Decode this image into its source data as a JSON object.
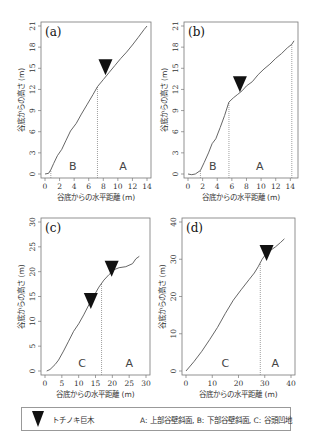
{
  "chart_data": [
    {
      "id": "a",
      "type": "line",
      "panel_label": "(a)",
      "xlabel": "谷底からの水平距離 (m)",
      "ylabel": "谷底からの高さ (m)",
      "xlim": [
        0,
        14
      ],
      "ylim": [
        0,
        21
      ],
      "xticks": [
        0,
        2,
        4,
        6,
        8,
        10,
        12,
        14
      ],
      "yticks": [
        0,
        3,
        6,
        9,
        12,
        15,
        18,
        21
      ],
      "x": [
        0,
        0.5,
        0.8,
        1.2,
        1.7,
        2.3,
        2.9,
        3.5,
        4.3,
        5.0,
        5.8,
        6.6,
        7.2,
        8.0,
        8.8,
        9.6,
        10.4,
        11.2,
        12.0,
        12.8,
        13.6,
        14.0
      ],
      "y": [
        0,
        0.1,
        0.6,
        1.5,
        2.6,
        3.5,
        4.8,
        6.1,
        7.2,
        8.5,
        9.9,
        11.3,
        12.4,
        13.4,
        14.4,
        15.4,
        16.4,
        17.3,
        18.3,
        19.4,
        20.5,
        21.0
      ],
      "boundaries_x": [
        0.8,
        7.2
      ],
      "zones": [
        {
          "label": "B",
          "x": 3.8
        },
        {
          "label": "A",
          "x": 10.7
        }
      ],
      "tree_markers": [
        {
          "x": 8.3,
          "y": 14.0
        }
      ]
    },
    {
      "id": "b",
      "type": "line",
      "panel_label": "(b)",
      "xlabel": "谷底からの水平距離 (m)",
      "ylabel": "谷底からの高さ (m)",
      "xlim": [
        0,
        14.5
      ],
      "ylim": [
        0,
        21
      ],
      "xticks": [
        0,
        2,
        4,
        6,
        8,
        10,
        12,
        14
      ],
      "yticks": [
        0,
        3,
        6,
        9,
        12,
        15,
        18,
        21
      ],
      "x": [
        0,
        0.5,
        1.0,
        1.7,
        2.2,
        2.8,
        3.3,
        3.8,
        4.4,
        5.0,
        5.6,
        6.2,
        6.8,
        7.4,
        8.0,
        8.8,
        9.6,
        10.4,
        11.2,
        12.0,
        12.8,
        13.6,
        14.2,
        14.5
      ],
      "y": [
        0,
        -0.1,
        0.0,
        0.5,
        1.6,
        3.0,
        4.3,
        5.0,
        6.6,
        8.3,
        10.2,
        10.8,
        11.3,
        11.8,
        12.5,
        13.1,
        14.1,
        14.9,
        15.6,
        16.4,
        17.1,
        17.9,
        18.4,
        18.9
      ],
      "boundaries_x": [
        1.7,
        5.6,
        14.2
      ],
      "zones": [
        {
          "label": "B",
          "x": 3.4
        },
        {
          "label": "A",
          "x": 9.8
        }
      ],
      "tree_markers": [
        {
          "x": 7.1,
          "y": 11.6
        }
      ]
    },
    {
      "id": "c",
      "type": "line",
      "panel_label": "(c)",
      "xlabel": "谷底からの水平距離 (m)",
      "ylabel": "谷底からの高さ (m)",
      "xlim": [
        0,
        30
      ],
      "ylim": [
        0,
        30
      ],
      "xticks": [
        0,
        5,
        10,
        15,
        20,
        25,
        30
      ],
      "yticks": [
        0,
        5,
        10,
        15,
        20,
        25,
        30
      ],
      "x": [
        0.5,
        1.5,
        3,
        4,
        5.5,
        7,
        8.5,
        10,
        11.5,
        13,
        14.5,
        16,
        17.5,
        19,
        20.5,
        22,
        24,
        26,
        27,
        28
      ],
      "y": [
        0,
        0.3,
        1.3,
        2.2,
        4.0,
        6.0,
        8.0,
        9.5,
        11.3,
        13.3,
        15.1,
        16.9,
        18.3,
        19.4,
        20.4,
        20.8,
        21.0,
        21.6,
        22.6,
        23.1
      ],
      "boundaries_x": [
        16.8
      ],
      "zones": [
        {
          "label": "C",
          "x": 11
        },
        {
          "label": "A",
          "x": 25
        }
      ],
      "tree_markers": [
        {
          "x": 13.6,
          "y": 12.5
        },
        {
          "x": 19.8,
          "y": 19.0
        }
      ]
    },
    {
      "id": "d",
      "type": "line",
      "panel_label": "(d)",
      "xlabel": "谷底からの水平距離 (m)",
      "ylabel": "谷底からの高さ (m)",
      "xlim": [
        0,
        40
      ],
      "ylim": [
        0,
        40
      ],
      "xticks": [
        0,
        10,
        20,
        30,
        40
      ],
      "yticks": [
        0,
        10,
        20,
        30,
        40
      ],
      "x": [
        0,
        3,
        6,
        9,
        12,
        15,
        18,
        21,
        24,
        26,
        27.5,
        29,
        30.5,
        32,
        34,
        36,
        37.5
      ],
      "y": [
        0,
        2.5,
        5.3,
        8.4,
        11.7,
        15.5,
        19.0,
        21.8,
        24.5,
        26.3,
        28.0,
        30.0,
        31.5,
        32.3,
        33.3,
        34.5,
        35.5
      ],
      "boundaries_x": [
        28.3
      ],
      "zones": [
        {
          "label": "C",
          "x": 15
        },
        {
          "label": "A",
          "x": 34
        }
      ],
      "tree_markers": [
        {
          "x": 30.7,
          "y": 29.5
        }
      ]
    }
  ],
  "legend": {
    "tree_label": "トチノキ巨木",
    "zones_label": "A: 上部谷壁斜面, B: 下部谷壁斜面, C: 谷頭凹地"
  },
  "colors": {
    "line": "#555555",
    "marker": "#111111",
    "frame": "#777777",
    "boundary": "#888888"
  }
}
